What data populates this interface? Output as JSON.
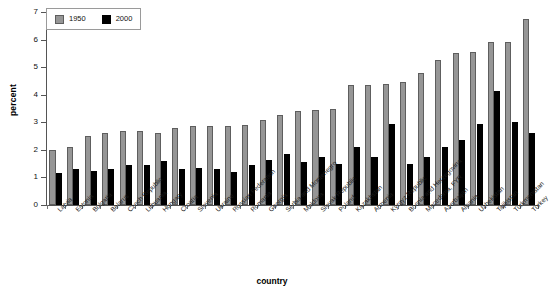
{
  "chart_data": {
    "type": "bar",
    "title": "",
    "xlabel": "country",
    "ylabel": "percent",
    "ylim": [
      0,
      7
    ],
    "yticks": [
      0,
      1,
      2,
      3,
      4,
      5,
      6,
      7
    ],
    "grid": false,
    "legend_position": "top-left",
    "categories": [
      "Latvia",
      "Estonia",
      "Bulgaria",
      "Belarus",
      "Czech Republic",
      "Lithuania",
      "Hungary",
      "Croatia",
      "Slovenia",
      "Ukraine",
      "Russian Federation",
      "Romania",
      "Georgia",
      "Serbia and Montenegro",
      "Moldova",
      "Slovak Republic",
      "Poland",
      "Kazakhstan",
      "Armenia",
      "Kyrgyz Republic",
      "Bosnia and Herzegovina",
      "Macedonia, FYR",
      "Azerbaijan",
      "Albania",
      "Uzbekistan",
      "Tajikistan",
      "Turkmenistan",
      "Turkey"
    ],
    "series": [
      {
        "name": "1950",
        "color": "#969696",
        "values": [
          2.0,
          2.1,
          2.5,
          2.6,
          2.7,
          2.7,
          2.6,
          2.8,
          2.85,
          2.85,
          2.85,
          2.9,
          3.1,
          3.25,
          3.4,
          3.45,
          3.5,
          4.35,
          4.35,
          4.4,
          4.45,
          4.8,
          5.25,
          5.5,
          5.55,
          5.9,
          5.9,
          6.75
        ]
      },
      {
        "name": "2000",
        "color": "#000000",
        "values": [
          1.15,
          1.3,
          1.25,
          1.3,
          1.45,
          1.45,
          1.6,
          1.3,
          1.35,
          1.3,
          1.2,
          1.45,
          1.65,
          1.85,
          1.55,
          1.75,
          1.5,
          2.1,
          1.75,
          2.95,
          1.5,
          1.75,
          2.1,
          2.35,
          2.95,
          4.15,
          3.0,
          2.6
        ]
      }
    ]
  },
  "legend": {
    "items": [
      {
        "label": "1950",
        "swatch": "gray-swatch"
      },
      {
        "label": "2000",
        "swatch": "black-swatch"
      }
    ]
  },
  "axes": {
    "y_title": "percent",
    "x_title": "country",
    "y_tick_labels": [
      "0",
      "1",
      "2",
      "3",
      "4",
      "5",
      "6",
      "7"
    ]
  }
}
